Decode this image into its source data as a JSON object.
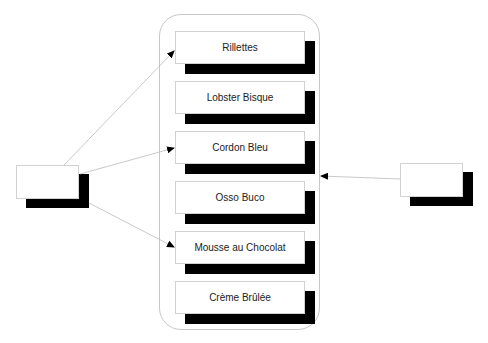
{
  "diagram": {
    "menu_items": [
      {
        "label": "Rillettes"
      },
      {
        "label": "Lobster Bisque"
      },
      {
        "label": "Cordon Bleu"
      },
      {
        "label": "Osso Buco"
      },
      {
        "label": "Mousse au Chocolat"
      },
      {
        "label": "Crème Brûlée"
      }
    ],
    "left_node": {
      "label": ""
    },
    "right_node": {
      "label": ""
    },
    "edges": [
      {
        "from": "left_node",
        "to": "Rillettes"
      },
      {
        "from": "left_node",
        "to": "Cordon Bleu"
      },
      {
        "from": "left_node",
        "to": "Mousse au Chocolat"
      },
      {
        "from": "right_node",
        "to": "container"
      }
    ],
    "colors": {
      "shadow": "#000000",
      "border": "#d2d2d2",
      "edge": "#bbbbbb"
    }
  }
}
